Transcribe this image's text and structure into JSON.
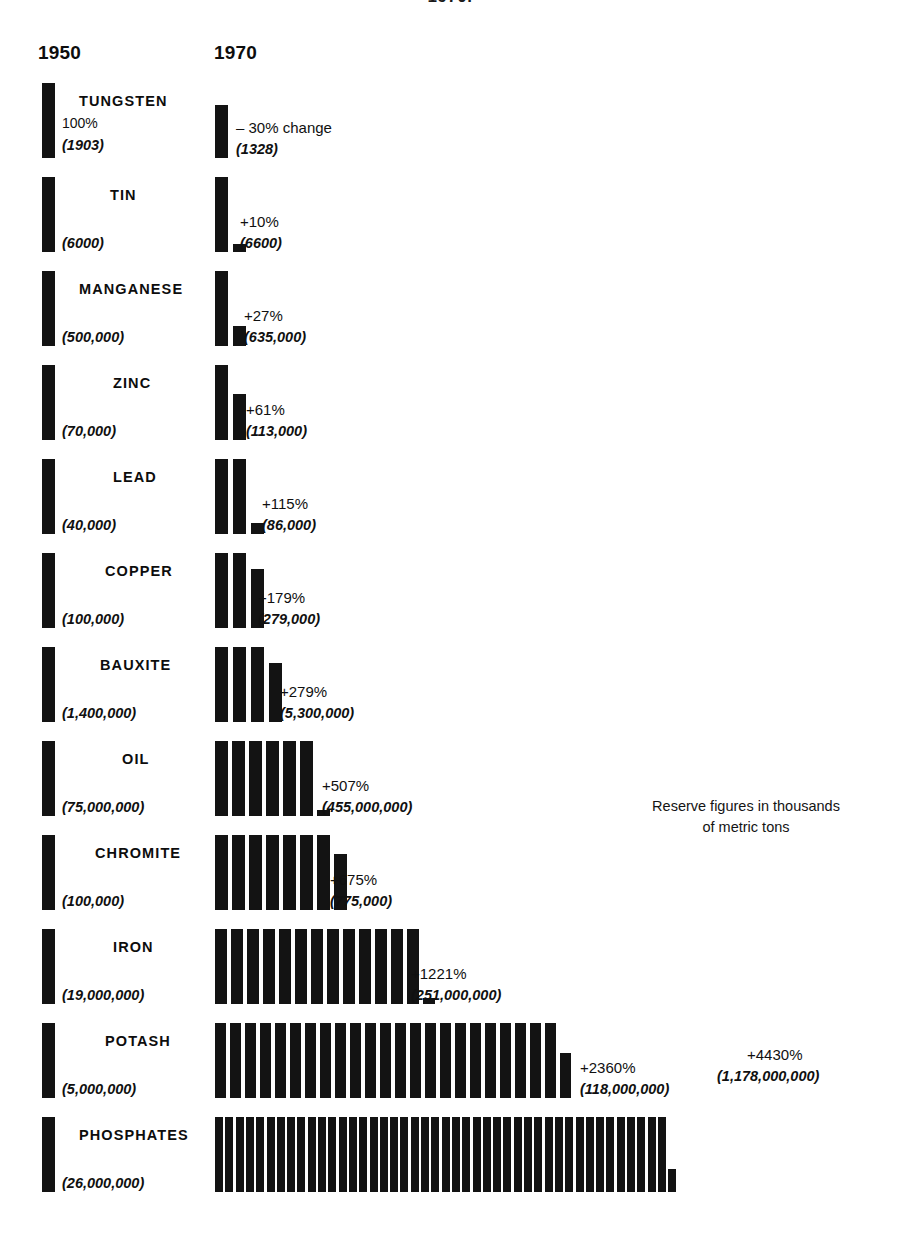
{
  "top_cropped_heading": "1970.",
  "columns": {
    "left_year": "1950",
    "right_year": "1970"
  },
  "legend": {
    "line1": "Reserve figures in thousands",
    "line2": "of metric tons"
  },
  "colors": {
    "bar": "#131313",
    "background": "#ffffff",
    "text": "#111111"
  },
  "chart_data": {
    "type": "bar",
    "subtitle": "Reserve figures in thousands of metric tons",
    "xlabel": "",
    "ylabel": "",
    "categories": [
      "TUNGSTEN",
      "TIN",
      "MANGANESE",
      "ZINC",
      "LEAD",
      "COPPER",
      "BAUXITE",
      "OIL",
      "CHROMITE",
      "IRON",
      "POTASH",
      "PHOSPHATES"
    ],
    "series": [
      {
        "name": "1950",
        "values": [
          1903,
          6000,
          500000,
          70000,
          40000,
          100000,
          1400000,
          75000000,
          100000,
          19000000,
          5000000,
          26000000
        ]
      },
      {
        "name": "1970",
        "values": [
          1328,
          6600,
          635000,
          113000,
          86000,
          279000,
          5300000,
          455000000,
          775000,
          251000000,
          118000000,
          1178000000
        ]
      }
    ],
    "percent_change": [
      -30,
      10,
      27,
      61,
      115,
      179,
      279,
      507,
      675,
      1221,
      2360,
      4430
    ]
  },
  "rows": [
    {
      "name": "TUNGSTEN",
      "name_left": 79,
      "base_pct": "100%",
      "base_val": "(1903)",
      "chg_pct": "– 30% change",
      "chg_val": "(1328)",
      "units_full": 0,
      "partial_pct": 70,
      "chg_text_left": 236,
      "row_top": 83,
      "bar_h": 75
    },
    {
      "name": "TIN",
      "name_left": 110,
      "base_pct": "",
      "base_val": "(6000)",
      "chg_pct": "+10%",
      "chg_val": "(6600)",
      "units_full": 1,
      "partial_pct": 10,
      "chg_text_left": 240,
      "row_top": 177,
      "bar_h": 75
    },
    {
      "name": "MANGANESE",
      "name_left": 79,
      "base_pct": "",
      "base_val": "(500,000)",
      "chg_pct": "+27%",
      "chg_val": "(635,000)",
      "units_full": 1,
      "partial_pct": 27,
      "chg_text_left": 244,
      "row_top": 271,
      "bar_h": 75
    },
    {
      "name": "ZINC",
      "name_left": 113,
      "base_pct": "",
      "base_val": "(70,000)",
      "chg_pct": "+61%",
      "chg_val": "(113,000)",
      "units_full": 1,
      "partial_pct": 61,
      "chg_text_left": 246,
      "row_top": 365,
      "bar_h": 75
    },
    {
      "name": "LEAD",
      "name_left": 113,
      "base_pct": "",
      "base_val": "(40,000)",
      "chg_pct": "+115%",
      "chg_val": "(86,000)",
      "units_full": 2,
      "partial_pct": 15,
      "chg_text_left": 262,
      "row_top": 459,
      "bar_h": 75
    },
    {
      "name": "COPPER",
      "name_left": 105,
      "base_pct": "",
      "base_val": "(100,000)",
      "chg_pct": "+179%",
      "chg_val": "(279,000)",
      "units_full": 2,
      "partial_pct": 79,
      "chg_text_left": 258,
      "row_top": 553,
      "bar_h": 75
    },
    {
      "name": "BAUXITE",
      "name_left": 100,
      "base_pct": "",
      "base_val": "(1,400,000)",
      "chg_pct": "+279%",
      "chg_val": "(5,300,000)",
      "units_full": 3,
      "partial_pct": 79,
      "chg_text_left": 280,
      "row_top": 647,
      "bar_h": 75
    },
    {
      "name": "OIL",
      "name_left": 122,
      "base_pct": "",
      "base_val": "(75,000,000)",
      "chg_pct": "+507%",
      "chg_val": "(455,000,000)",
      "units_full": 6,
      "partial_pct": 7,
      "chg_text_left": 322,
      "row_top": 741,
      "bar_h": 75
    },
    {
      "name": "CHROMITE",
      "name_left": 95,
      "base_pct": "",
      "base_val": "(100,000)",
      "chg_pct": "+675%",
      "chg_val": "(775,000)",
      "units_full": 7,
      "partial_pct": 75,
      "chg_text_left": 330,
      "row_top": 835,
      "bar_h": 75
    },
    {
      "name": "IRON",
      "name_left": 113,
      "base_pct": "",
      "base_val": "(19,000,000)",
      "chg_pct": "+1221%",
      "chg_val": "(251,000,000)",
      "units_full": 13,
      "partial_pct": 7,
      "chg_text_left": 411,
      "row_top": 929,
      "bar_h": 75
    },
    {
      "name": "POTASH",
      "name_left": 105,
      "base_pct": "",
      "base_val": "(5,000,000)",
      "chg_pct": "+2360%",
      "chg_val": "(118,000,000)",
      "units_full": 23,
      "partial_pct": 60,
      "chg_text_left": 580,
      "row_top": 1023,
      "bar_h": 75
    },
    {
      "name": "PHOSPHATES",
      "name_left": 79,
      "base_pct": "",
      "base_val": "(26,000,000)",
      "chg_pct": "",
      "chg_val": "",
      "units_full": 44,
      "partial_pct": 30,
      "chg_text_left": 0,
      "row_top": 1117,
      "bar_h": 75
    }
  ],
  "extra_label": {
    "pct": "+4430%",
    "val": "(1,178,000,000)",
    "left": 747,
    "top": 1046
  }
}
